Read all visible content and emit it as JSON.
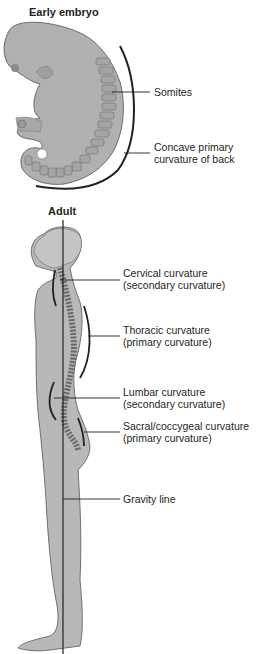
{
  "embryo": {
    "title": "Early embryo",
    "labels": {
      "somites": "Somites",
      "curvature_line1": "Concave primary",
      "curvature_line2": "curvature of back"
    }
  },
  "adult": {
    "title": "Adult",
    "labels": {
      "cervical_line1": "Cervical curvature",
      "cervical_line2": "(secondary curvature)",
      "thoracic_line1": "Thoracic curvature",
      "thoracic_line2": "(primary curvature)",
      "lumbar_line1": "Lumbar curvature",
      "lumbar_line2": "(secondary curvature)",
      "sacral_line1": "Sacral/coccygeal curvature",
      "sacral_line2": "(primary curvature)",
      "gravity": "Gravity line"
    }
  },
  "colors": {
    "body_fill": "#b8b8b8",
    "outline": "#5a5a5a",
    "line": "#231f20"
  }
}
